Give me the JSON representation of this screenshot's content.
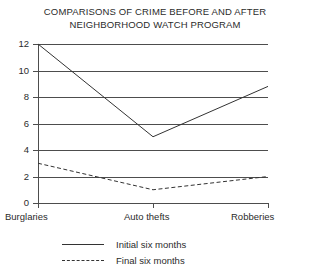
{
  "chart_data": {
    "type": "line",
    "title": "COMPARISONS OF CRIME BEFORE AND AFTER NEIGHBORHOOD WATCH PROGRAM",
    "title_lines": [
      "COMPARISONS OF CRIME BEFORE AND AFTER",
      "NEIGHBORHOOD WATCH PROGRAM"
    ],
    "xlabel": "",
    "ylabel": "",
    "categories": [
      "Burglaries",
      "Auto thefts",
      "Robberies"
    ],
    "ylim": [
      0,
      12
    ],
    "yticks": [
      0,
      2,
      4,
      6,
      8,
      10,
      12
    ],
    "ytick_labels": [
      "0",
      "2",
      "4",
      "6",
      "8",
      "10",
      "12"
    ],
    "grid": true,
    "legend_position": "bottom",
    "series": [
      {
        "name": "Initial six months",
        "style": "solid",
        "color": "#333333",
        "values": [
          12,
          5,
          8.8
        ]
      },
      {
        "name": "Final six months",
        "style": "dashed",
        "color": "#333333",
        "values": [
          3,
          1,
          2
        ]
      }
    ]
  },
  "legend": {
    "items": [
      {
        "label": "Initial six months",
        "style": "solid"
      },
      {
        "label": "Final six months",
        "style": "dashed"
      }
    ]
  }
}
